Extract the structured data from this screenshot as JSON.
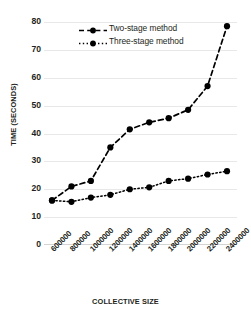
{
  "chart_data": {
    "type": "line",
    "title": "",
    "xlabel": "COLLECTIVE SIZE",
    "ylabel": "TIME (SECONDS)",
    "categories": [
      "600000",
      "800000",
      "1000000",
      "1200000",
      "1400000",
      "1600000",
      "1800000",
      "2000000",
      "2200000",
      "2400000"
    ],
    "x": [
      600000,
      800000,
      1000000,
      1200000,
      1400000,
      1600000,
      1800000,
      2000000,
      2200000,
      2400000
    ],
    "series": [
      {
        "name": "Two-stage method",
        "values": [
          16,
          21,
          23,
          35,
          41.5,
          44,
          45.5,
          48.5,
          57,
          78.5
        ],
        "line_style": "dashed",
        "marker": "filled-circle",
        "color": "#000000"
      },
      {
        "name": "Three-stage method",
        "values": [
          16,
          15.5,
          17,
          18,
          20,
          20.7,
          23,
          23.8,
          25.3,
          26.5
        ],
        "line_style": "dotted",
        "marker": "filled-circle",
        "color": "#000000"
      }
    ],
    "ylim": [
      0,
      80
    ],
    "yticks": [
      0,
      10,
      20,
      30,
      40,
      50,
      60,
      70,
      80
    ],
    "ytick_labels": [
      "0",
      "10",
      "20",
      "30",
      "40",
      "50",
      "60",
      "70",
      "80"
    ],
    "grid": true,
    "grid_axis": "y",
    "grid_color": "#e8e8e8",
    "legend_position": "top-center",
    "background_color": "#ffffff",
    "axis_label_color": "#231f20"
  },
  "legend": {
    "entries": [
      {
        "label": "Two-stage method"
      },
      {
        "label": "Three-stage method"
      }
    ]
  }
}
